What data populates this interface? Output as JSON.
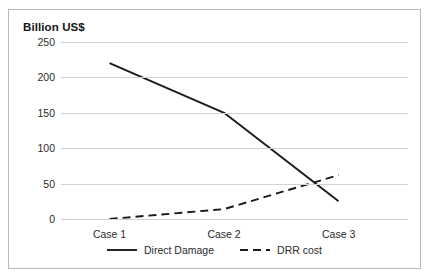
{
  "chart_data": {
    "type": "line",
    "title": "Billion US$",
    "xlabel": "",
    "ylabel": "Billion US$",
    "categories": [
      "Case 1",
      "Case 2",
      "Case 3"
    ],
    "series": [
      {
        "name": "Direct Damage",
        "style": "solid",
        "color": "#1a1a1a",
        "values": [
          220,
          150,
          25
        ]
      },
      {
        "name": "DRR cost",
        "style": "dashed",
        "color": "#1a1a1a",
        "values": [
          0,
          14,
          62
        ]
      }
    ],
    "yticks": [
      250,
      200,
      150,
      100,
      50,
      0
    ],
    "ylim": [
      0,
      250
    ],
    "grid": true,
    "legend_position": "bottom",
    "gridline_color": "#d2d2d2",
    "frame_color": "#b9b9b9",
    "background": "#ffffff"
  }
}
